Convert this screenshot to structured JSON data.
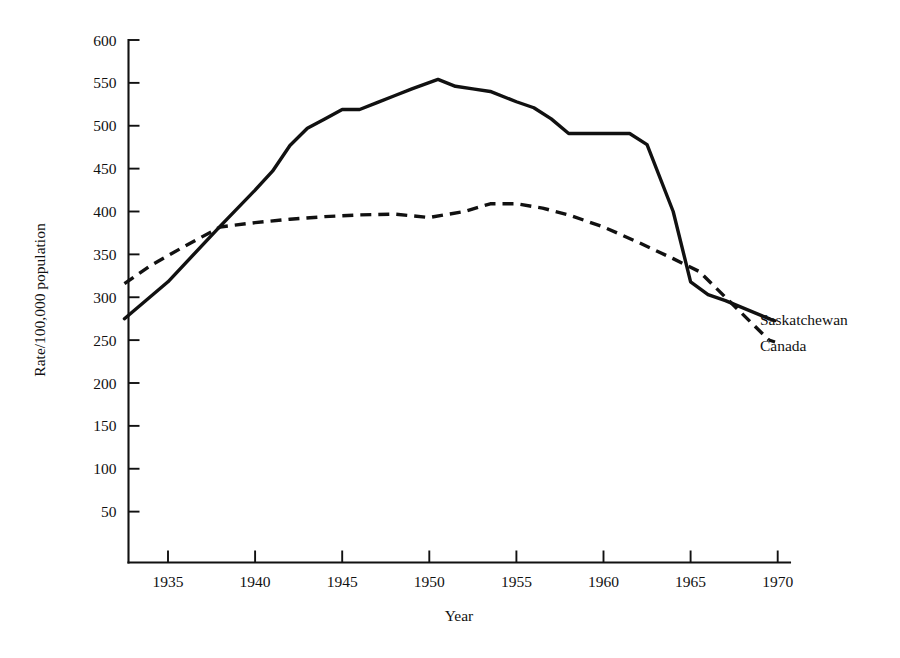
{
  "chart_data": {
    "type": "line",
    "title": "",
    "xlabel": "Year",
    "ylabel": "Rate/100,000 population",
    "xlim": [
      1932,
      1971
    ],
    "ylim": [
      0,
      600
    ],
    "grid": false,
    "legend_position": "right-inline-labels",
    "x_ticks": [
      "1935",
      "1940",
      "1945",
      "1950",
      "1955",
      "1960",
      "1965",
      "1970"
    ],
    "x_tick_values": [
      1935,
      1940,
      1945,
      1950,
      1955,
      1960,
      1965,
      1970
    ],
    "y_ticks": [
      "50",
      "100",
      "150",
      "200",
      "250",
      "300",
      "350",
      "400",
      "450",
      "500",
      "550",
      "600"
    ],
    "y_tick_values": [
      50,
      100,
      150,
      200,
      250,
      300,
      350,
      400,
      450,
      500,
      550,
      600
    ],
    "series": [
      {
        "name": "Saskatchewan",
        "style": "solid",
        "color": "#111111",
        "x": [
          1932.5,
          1935,
          1938,
          1940,
          1941,
          1942,
          1943,
          1944,
          1945,
          1946,
          1947,
          1948,
          1949,
          1950.5,
          1951.5,
          1952.5,
          1953.5,
          1955,
          1956,
          1957,
          1958,
          1959,
          1961.5,
          1962.5,
          1964,
          1965,
          1966,
          1967,
          1969.5
        ],
        "values": [
          275,
          318,
          383,
          425,
          447,
          477,
          497,
          508,
          519,
          519,
          527,
          535,
          543,
          554,
          546,
          543,
          540,
          528,
          521,
          508,
          491,
          491,
          491,
          478,
          400,
          318,
          303,
          296,
          275
        ]
      },
      {
        "name": "Canada",
        "style": "dashed",
        "color": "#111111",
        "x": [
          1932.5,
          1934,
          1936,
          1938,
          1940,
          1942,
          1944,
          1946,
          1948,
          1950,
          1952,
          1953.5,
          1955,
          1956.5,
          1958,
          1960,
          1962,
          1964,
          1965.5,
          1967,
          1969.5
        ],
        "values": [
          316,
          337,
          360,
          382,
          387,
          391,
          394,
          396,
          397,
          393,
          400,
          409,
          409,
          404,
          396,
          382,
          364,
          345,
          330,
          300,
          250
        ]
      }
    ]
  },
  "series_labels": {
    "saskatchewan": "Saskatchewan",
    "canada": "Canada"
  }
}
